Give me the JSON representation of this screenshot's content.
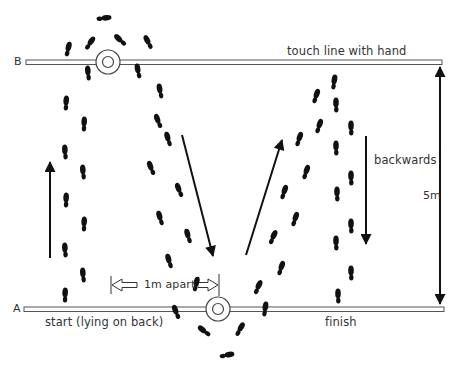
{
  "labels": {
    "line_b": "B",
    "line_a": "A",
    "touch_line": "touch line with hand",
    "start": "start (lying on back)",
    "finish": "finish",
    "backwards": "backwards",
    "distance": "5m",
    "spacing": "1m apart"
  },
  "lines": {
    "B": {
      "y": 62,
      "x_start": 26,
      "x_end": 442
    },
    "A": {
      "y": 309,
      "x_start": 24,
      "x_end": 444
    }
  },
  "cones": [
    {
      "name": "cone-top",
      "cx": 108,
      "cy": 62
    },
    {
      "name": "cone-bottom",
      "cx": 218,
      "cy": 309
    }
  ],
  "arrows": [
    {
      "name": "arrow-up-left",
      "x1": 50,
      "y1": 258,
      "x2": 50,
      "y2": 160
    },
    {
      "name": "arrow-down-diagonal",
      "x1": 182,
      "y1": 135,
      "x2": 214,
      "y2": 258
    },
    {
      "name": "arrow-up-diagonal",
      "x1": 246,
      "y1": 255,
      "x2": 283,
      "y2": 138
    },
    {
      "name": "arrow-down-backwards",
      "x1": 366,
      "y1": 136,
      "x2": 366,
      "y2": 245
    },
    {
      "name": "arrow-5m-double",
      "x1": 440,
      "y1": 66,
      "x2": 440,
      "y2": 305
    }
  ],
  "footprints": [
    {
      "x": 66,
      "y": 103,
      "r": 5
    },
    {
      "x": 65,
      "y": 152,
      "r": -3
    },
    {
      "x": 66,
      "y": 200,
      "r": 3
    },
    {
      "x": 65,
      "y": 250,
      "r": -3
    },
    {
      "x": 65,
      "y": 295,
      "r": 3
    },
    {
      "x": 88,
      "y": 73,
      "r": -4
    },
    {
      "x": 84,
      "y": 124,
      "r": 4
    },
    {
      "x": 83,
      "y": 172,
      "r": -4
    },
    {
      "x": 84,
      "y": 224,
      "r": 4
    },
    {
      "x": 83,
      "y": 275,
      "r": -4
    },
    {
      "x": 68,
      "y": 49,
      "r": 15
    },
    {
      "x": 90,
      "y": 43,
      "r": 35
    },
    {
      "x": 104,
      "y": 18,
      "r": 85
    },
    {
      "x": 120,
      "y": 40,
      "r": -45
    },
    {
      "x": 148,
      "y": 42,
      "r": -25
    },
    {
      "x": 138,
      "y": 71,
      "r": -10
    },
    {
      "x": 160,
      "y": 91,
      "r": -10
    },
    {
      "x": 158,
      "y": 121,
      "r": -20
    },
    {
      "x": 168,
      "y": 139,
      "r": -15
    },
    {
      "x": 151,
      "y": 168,
      "r": -20
    },
    {
      "x": 179,
      "y": 190,
      "r": -20
    },
    {
      "x": 160,
      "y": 218,
      "r": -15
    },
    {
      "x": 188,
      "y": 236,
      "r": -15
    },
    {
      "x": 169,
      "y": 261,
      "r": -15
    },
    {
      "x": 196,
      "y": 284,
      "r": 15
    },
    {
      "x": 176,
      "y": 312,
      "r": -20
    },
    {
      "x": 204,
      "y": 331,
      "r": -50
    },
    {
      "x": 227,
      "y": 355,
      "r": 80
    },
    {
      "x": 240,
      "y": 329,
      "r": 30
    },
    {
      "x": 265,
      "y": 309,
      "r": 10
    },
    {
      "x": 258,
      "y": 287,
      "r": 25
    },
    {
      "x": 281,
      "y": 268,
      "r": 20
    },
    {
      "x": 273,
      "y": 237,
      "r": 25
    },
    {
      "x": 295,
      "y": 219,
      "r": 20
    },
    {
      "x": 284,
      "y": 192,
      "r": 20
    },
    {
      "x": 306,
      "y": 172,
      "r": 20
    },
    {
      "x": 299,
      "y": 139,
      "r": 20
    },
    {
      "x": 319,
      "y": 126,
      "r": 20
    },
    {
      "x": 316,
      "y": 96,
      "r": 20
    },
    {
      "x": 334,
      "y": 82,
      "r": 10
    },
    {
      "x": 336,
      "y": 105,
      "r": 0
    },
    {
      "x": 336,
      "y": 148,
      "r": 0
    },
    {
      "x": 337,
      "y": 194,
      "r": 0
    },
    {
      "x": 336,
      "y": 243,
      "r": 0
    },
    {
      "x": 338,
      "y": 296,
      "r": 0
    },
    {
      "x": 351,
      "y": 128,
      "r": 0
    },
    {
      "x": 351,
      "y": 178,
      "r": 0
    },
    {
      "x": 351,
      "y": 226,
      "r": 0
    },
    {
      "x": 351,
      "y": 273,
      "r": 0
    }
  ],
  "spacing_marker": {
    "x_left": 111,
    "x_right": 219,
    "y": 285
  }
}
